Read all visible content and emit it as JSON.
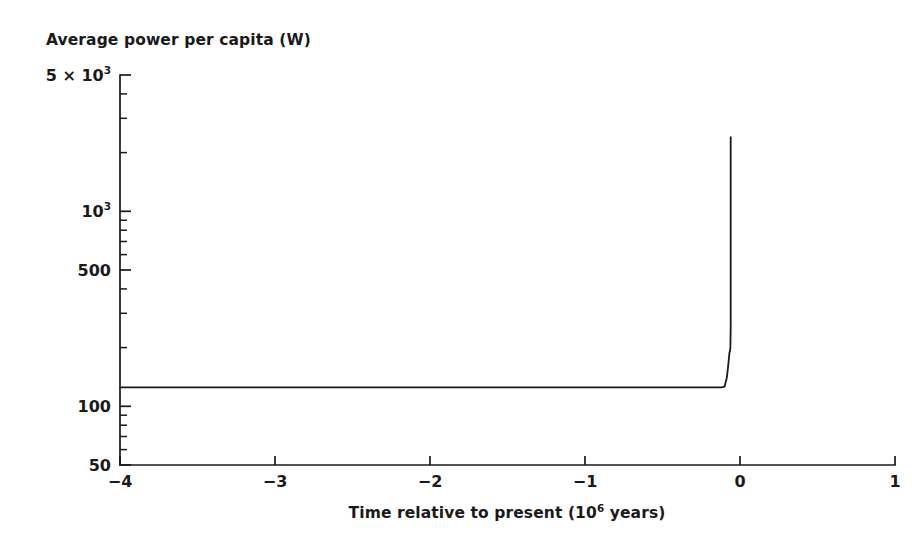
{
  "figure": {
    "background_color": "#ffffff",
    "line_color": "#1a1a1a"
  },
  "chart_data": {
    "type": "line",
    "title": "",
    "xlabel_plain": "Time relative to present (10^6 years)",
    "xlabel_prefix": "Time relative to present (10",
    "xlabel_exponent": "6",
    "xlabel_suffix": " years)",
    "ylabel_plain": "Average power per capita (W)",
    "xlim": [
      -4,
      1
    ],
    "ylim": [
      50,
      5000
    ],
    "yscale": "log",
    "xscale": "linear",
    "grid": false,
    "legend": null,
    "x_ticks": [
      {
        "value": -4,
        "label": "−4"
      },
      {
        "value": -3,
        "label": "−3"
      },
      {
        "value": -2,
        "label": "−2"
      },
      {
        "value": -1,
        "label": "−1"
      },
      {
        "value": 0,
        "label": "0"
      },
      {
        "value": 1,
        "label": "1"
      }
    ],
    "y_ticks_major": [
      {
        "value": 50,
        "label": "50",
        "exponent": ""
      },
      {
        "value": 100,
        "label": "100",
        "exponent": ""
      },
      {
        "value": 500,
        "label": "500",
        "exponent": ""
      },
      {
        "value": 1000,
        "label": "10",
        "exponent": "3"
      },
      {
        "value": 5000,
        "label": "5 × 10",
        "exponent": "3"
      }
    ],
    "y_ticks_minor": [
      60,
      70,
      80,
      90,
      200,
      300,
      400,
      600,
      700,
      800,
      900,
      2000,
      3000,
      4000
    ],
    "series": [
      {
        "name": "Average power per capita",
        "x": [
          -4.0,
          -3.5,
          -3.0,
          -2.5,
          -2.0,
          -1.5,
          -1.0,
          -0.5,
          -0.2,
          -0.12,
          -0.1,
          -0.085,
          -0.075,
          -0.07,
          -0.068,
          -0.065,
          -0.062,
          -0.06,
          -0.06
        ],
        "y": [
          125,
          125,
          125,
          125,
          125,
          125,
          125,
          125,
          125,
          125,
          126,
          140,
          165,
          182,
          188,
          192,
          200,
          260,
          2400
        ]
      }
    ]
  }
}
